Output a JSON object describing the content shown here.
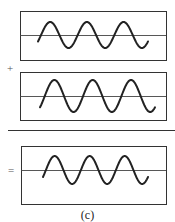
{
  "figure": {
    "caption": "(c)",
    "operators": {
      "plus": "+",
      "equals": "="
    },
    "colors": {
      "stroke": "#222222",
      "frame": "#333333",
      "axis": "#444444",
      "background": "#ffffff"
    },
    "panels": [
      {
        "name": "wave-1",
        "box": {
          "x": 20,
          "y": 11,
          "w": 146,
          "h": 49
        },
        "axis_y": 35,
        "wave": {
          "x_start": 38,
          "x_end": 148,
          "cycles": 3,
          "amplitude": 13,
          "start_phase_deg": -30
        }
      },
      {
        "name": "wave-2",
        "box": {
          "x": 20,
          "y": 72,
          "w": 146,
          "h": 48
        },
        "axis_y": 96,
        "wave": {
          "x_start": 40,
          "x_end": 155,
          "cycles": 3,
          "amplitude": 16,
          "start_phase_deg": -45
        }
      },
      {
        "name": "wave-sum",
        "box": {
          "x": 21,
          "y": 146,
          "w": 145,
          "h": 58
        },
        "axis_y": 170,
        "wave": {
          "x_start": 43,
          "x_end": 148,
          "cycles": 3,
          "amplitude": 14,
          "start_phase_deg": -30
        }
      }
    ],
    "separator": {
      "x1": 8,
      "x2": 175,
      "y": 130
    }
  }
}
